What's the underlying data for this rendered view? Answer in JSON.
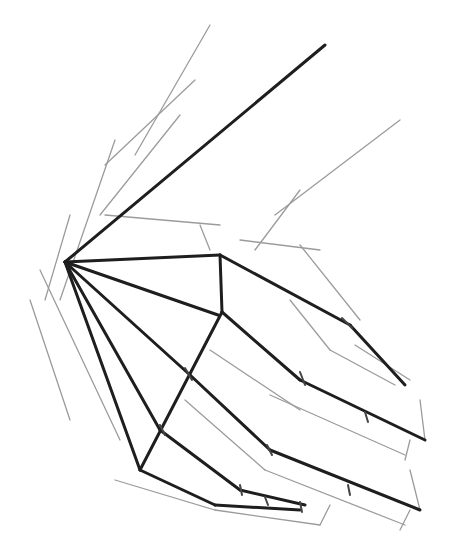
{
  "image": {
    "subject": "pencil construction sketch of a hand",
    "background": "#ffffff",
    "stroke_color": "#1e1e1e",
    "width": 460,
    "height": 559
  },
  "strokes": {
    "dark": [
      [
        65,
        262,
        325,
        45
      ],
      [
        65,
        262,
        220,
        255
      ],
      [
        220,
        255,
        222,
        312
      ],
      [
        222,
        312,
        140,
        470
      ],
      [
        65,
        262,
        140,
        470
      ],
      [
        65,
        262,
        218,
        315
      ],
      [
        220,
        255,
        350,
        325
      ],
      [
        350,
        325,
        405,
        385
      ],
      [
        222,
        312,
        300,
        380
      ],
      [
        300,
        380,
        425,
        440
      ],
      [
        190,
        375,
        270,
        450
      ],
      [
        270,
        450,
        420,
        510
      ],
      [
        160,
        430,
        240,
        490
      ],
      [
        240,
        490,
        305,
        505
      ],
      [
        140,
        470,
        215,
        505
      ],
      [
        215,
        505,
        300,
        510
      ],
      [
        65,
        262,
        190,
        375
      ],
      [
        65,
        262,
        160,
        430
      ]
    ],
    "light": [
      [
        210,
        25,
        135,
        155
      ],
      [
        195,
        80,
        105,
        165
      ],
      [
        180,
        115,
        100,
        215
      ],
      [
        115,
        140,
        60,
        300
      ],
      [
        70,
        215,
        45,
        300
      ],
      [
        30,
        300,
        70,
        420
      ],
      [
        40,
        270,
        120,
        440
      ],
      [
        105,
        215,
        220,
        225
      ],
      [
        200,
        225,
        210,
        250
      ],
      [
        300,
        190,
        255,
        250
      ],
      [
        400,
        120,
        275,
        215
      ],
      [
        240,
        240,
        320,
        250
      ],
      [
        300,
        245,
        360,
        320
      ],
      [
        290,
        300,
        330,
        350
      ],
      [
        330,
        350,
        395,
        385
      ],
      [
        355,
        345,
        410,
        380
      ],
      [
        210,
        350,
        300,
        410
      ],
      [
        270,
        395,
        405,
        455
      ],
      [
        420,
        400,
        425,
        440
      ],
      [
        410,
        440,
        405,
        460
      ],
      [
        185,
        400,
        265,
        470
      ],
      [
        265,
        470,
        405,
        525
      ],
      [
        410,
        470,
        420,
        510
      ],
      [
        410,
        510,
        400,
        530
      ],
      [
        115,
        480,
        215,
        510
      ],
      [
        215,
        510,
        320,
        525
      ],
      [
        320,
        525,
        330,
        505
      ]
    ]
  }
}
